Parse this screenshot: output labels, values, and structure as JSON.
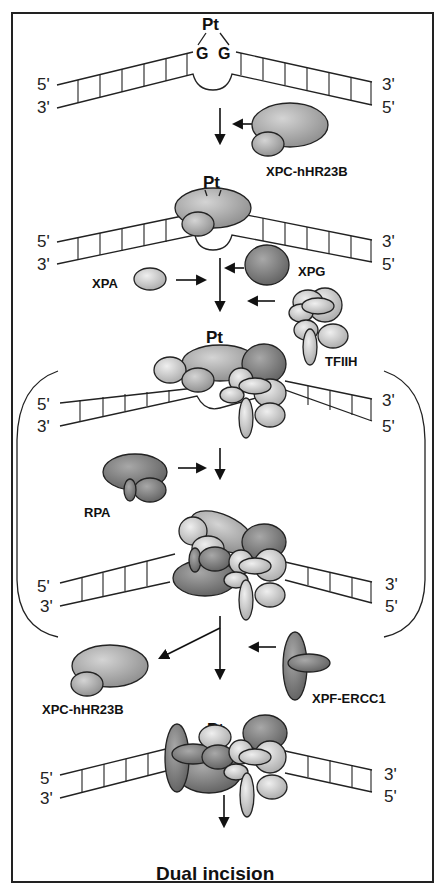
{
  "figure": {
    "frame": {
      "x": 12,
      "y": 13,
      "w": 421,
      "h": 869
    },
    "colors": {
      "light": "#d8d8d8",
      "mid": "#b4b4b4",
      "dark": "#8c8c8c",
      "outline": "#222222"
    }
  },
  "labels": {
    "pt": "Pt",
    "g1": "G",
    "g2": "G",
    "end5": "5'",
    "end3": "3'",
    "xpc_in": "XPC-hHR23B",
    "xpa": "XPA",
    "xpg": "XPG",
    "tfiih": "TFIIH",
    "rpa": "RPA",
    "xpc_out": "XPC-hHR23B",
    "xpf": "XPF-ERCC1",
    "final": "Dual incision"
  },
  "steps": [
    {
      "id": "step1",
      "dna_y": 82,
      "label_left_top": "5'",
      "label_left_bot": "3'",
      "label_right_top": "3'",
      "label_right_bot": "5'"
    },
    {
      "id": "step2",
      "dna_y": 232,
      "label_left_top": "5'",
      "label_left_bot": "3'",
      "label_right_top": "3'",
      "label_right_bot": "5'"
    },
    {
      "id": "step3",
      "dna_y": 402,
      "label_left_top": "5'",
      "label_left_bot": "3'",
      "label_right_top": "3'",
      "label_right_bot": "5'"
    },
    {
      "id": "step4",
      "dna_y": 588,
      "label_left_top": "5'",
      "label_left_bot": "3'",
      "label_right_top": "3'",
      "label_right_bot": "5'"
    },
    {
      "id": "step5",
      "dna_y": 773,
      "label_left_top": "5'",
      "label_left_bot": "3'",
      "label_right_top": "3'",
      "label_right_bot": "5'"
    }
  ]
}
